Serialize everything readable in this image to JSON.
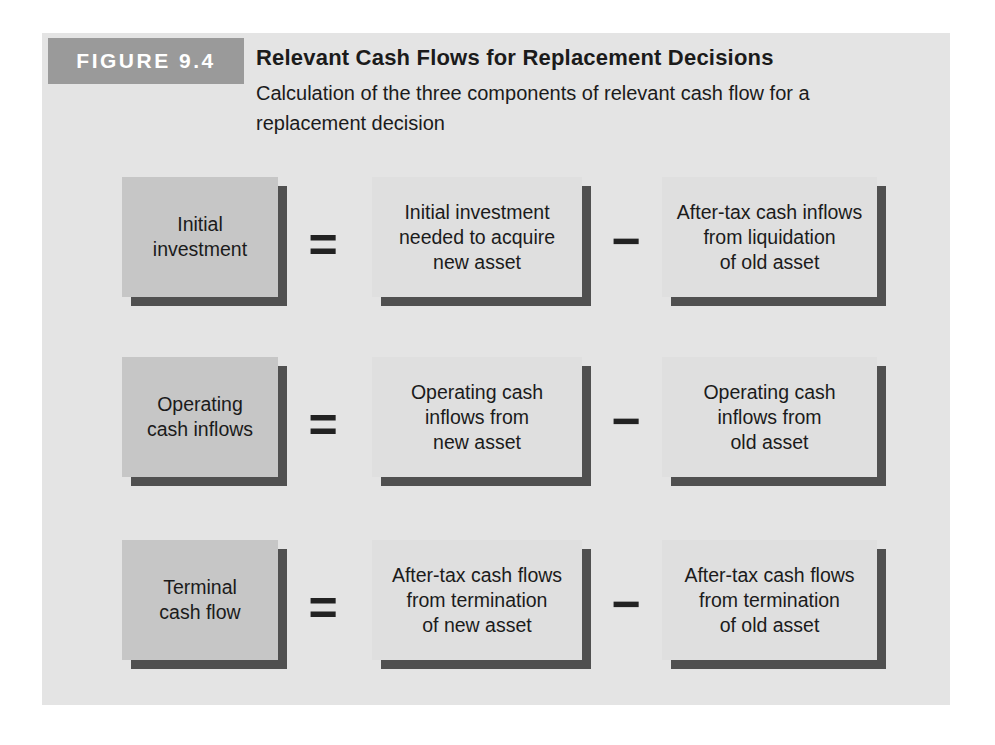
{
  "figure_header": {
    "badge": "FIGURE 9.4",
    "title": "Relevant Cash Flows for Replacement Decisions",
    "subtitle": "Calculation of the three components of relevant cash flow for a replacement decision"
  },
  "equation_rows": [
    {
      "result": "Initial\ninvestment",
      "equals": "=",
      "minuend": "Initial investment\nneeded to acquire\nnew asset",
      "minus": "−",
      "subtrahend": "After-tax cash inflows\nfrom liquidation\nof old asset"
    },
    {
      "result": "Operating\ncash inflows",
      "equals": "=",
      "minuend": "Operating cash\ninflows from\nnew asset",
      "minus": "−",
      "subtrahend": "Operating cash\ninflows from\nold asset"
    },
    {
      "result": "Terminal\ncash flow",
      "equals": "=",
      "minuend": "After-tax cash flows\nfrom termination\nof new asset",
      "minus": "−",
      "subtrahend": "After-tax cash flows\nfrom termination\nof old asset"
    }
  ],
  "colors": {
    "page_background": "#ffffff",
    "panel_background": "#e4e4e4",
    "badge_background": "#9a9a9a",
    "badge_text": "#ffffff",
    "result_box_fill": "#c6c6c6",
    "component_box_fill": "#dfdfdf",
    "box_shadow": "#505050",
    "text": "#1b1b1b"
  }
}
